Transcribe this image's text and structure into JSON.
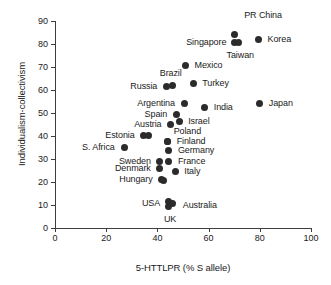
{
  "chart_data": {
    "type": "scatter",
    "title": "",
    "xlabel": "5-HTTLPR (% S allele)",
    "ylabel": "Individualism-collectivism",
    "xlim": [
      0,
      100
    ],
    "ylim": [
      0,
      90
    ],
    "xticks": [
      0,
      20,
      40,
      60,
      80,
      100
    ],
    "yticks": [
      0,
      10,
      20,
      30,
      40,
      50,
      60,
      70,
      80,
      90
    ],
    "grid": false,
    "legend": "none",
    "points": [
      {
        "label": "PR China",
        "x": 70.0,
        "y": 84.0,
        "lx": 10,
        "ly": -19,
        "anchor": "left"
      },
      {
        "label": "Singapore",
        "x": 70.0,
        "y": 80.5,
        "lx": -8,
        "ly": 0,
        "anchor": "right"
      },
      {
        "label": "Taiwan",
        "x": 71.5,
        "y": 80.5,
        "lx": 2,
        "ly": 13,
        "anchor": "center"
      },
      {
        "label": "Korea",
        "x": 79.5,
        "y": 82.0,
        "lx": 9,
        "ly": 0,
        "anchor": "left"
      },
      {
        "label": "Mexico",
        "x": 51.0,
        "y": 70.5,
        "lx": 9,
        "ly": 0,
        "anchor": "left"
      },
      {
        "label": "Brazil",
        "x": 46.0,
        "y": 62.0,
        "lx": -2,
        "ly": -12,
        "anchor": "center"
      },
      {
        "label": "Russia",
        "x": 43.5,
        "y": 61.5,
        "lx": -9,
        "ly": 0,
        "anchor": "right"
      },
      {
        "label": "Turkey",
        "x": 54.0,
        "y": 63.0,
        "lx": 9,
        "ly": 0,
        "anchor": "left"
      },
      {
        "label": "Argentina",
        "x": 50.5,
        "y": 54.0,
        "lx": -9,
        "ly": 0,
        "anchor": "right"
      },
      {
        "label": "India",
        "x": 58.5,
        "y": 52.5,
        "lx": 9,
        "ly": 0,
        "anchor": "left"
      },
      {
        "label": "Japan",
        "x": 80.0,
        "y": 54.0,
        "lx": 9,
        "ly": 0,
        "anchor": "left"
      },
      {
        "label": "Spain",
        "x": 47.5,
        "y": 49.5,
        "lx": -9,
        "ly": 0,
        "anchor": "right"
      },
      {
        "label": "Austria",
        "x": 45.0,
        "y": 45.0,
        "lx": -9,
        "ly": 0,
        "anchor": "right"
      },
      {
        "label": "Israel",
        "x": 48.5,
        "y": 46.5,
        "lx": 9,
        "ly": 0,
        "anchor": "left"
      },
      {
        "label": "Estonia",
        "x": 34.5,
        "y": 40.3,
        "lx": -9,
        "ly": 0,
        "anchor": "right"
      },
      {
        "label": "",
        "x": 36.5,
        "y": 40.3,
        "lx": 0,
        "ly": 0,
        "anchor": "left"
      },
      {
        "label": "Poland",
        "x": 44.0,
        "y": 37.5,
        "lx": 6,
        "ly": -10,
        "anchor": "left"
      },
      {
        "label": "Finland",
        "x": 44.0,
        "y": 37.5,
        "lx": 9,
        "ly": 0,
        "anchor": "left"
      },
      {
        "label": "Germany",
        "x": 44.5,
        "y": 33.5,
        "lx": 9,
        "ly": 0,
        "anchor": "left"
      },
      {
        "label": "S. Africa",
        "x": 27.0,
        "y": 35.0,
        "lx": -9,
        "ly": 0,
        "anchor": "right"
      },
      {
        "label": "France",
        "x": 44.5,
        "y": 29.0,
        "lx": 9,
        "ly": 0,
        "anchor": "left"
      },
      {
        "label": "Sweden",
        "x": 41.0,
        "y": 29.0,
        "lx": -9,
        "ly": 0,
        "anchor": "right"
      },
      {
        "label": "Denmark",
        "x": 41.0,
        "y": 26.0,
        "lx": -9,
        "ly": 0,
        "anchor": "right"
      },
      {
        "label": "Italy",
        "x": 47.0,
        "y": 24.5,
        "lx": 9,
        "ly": 0,
        "anchor": "left"
      },
      {
        "label": "Hungary",
        "x": 41.5,
        "y": 21.0,
        "lx": -9,
        "ly": 0,
        "anchor": "right"
      },
      {
        "label": "",
        "x": 42.5,
        "y": 20.5,
        "lx": 0,
        "ly": 0,
        "anchor": "left"
      },
      {
        "label": "USA",
        "x": 44.5,
        "y": 11.5,
        "lx": -9,
        "ly": 2,
        "anchor": "right"
      },
      {
        "label": "Australia",
        "x": 46.0,
        "y": 10.5,
        "lx": 10,
        "ly": 2,
        "anchor": "left"
      },
      {
        "label": "UK",
        "x": 44.5,
        "y": 9.5,
        "lx": 1,
        "ly": 13,
        "anchor": "center"
      }
    ]
  }
}
